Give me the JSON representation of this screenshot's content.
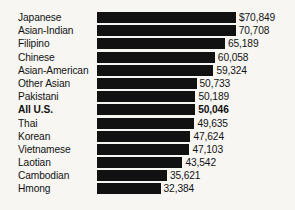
{
  "chart_data": {
    "type": "bar",
    "orientation": "horizontal",
    "title": "",
    "subtitle": "",
    "xlabel": "",
    "ylabel": "",
    "grid": false,
    "legend": false,
    "axis_visible": false,
    "xlim": [
      0,
      70849
    ],
    "bar_color": "#111111",
    "background_color": "#f7f6f3",
    "text_color": "#121212",
    "categories": [
      "Japanese",
      "Asian-Indian",
      "Filipino",
      "Chinese",
      "Asian-American",
      "Other Asian",
      "Pakistani",
      "All U.S.",
      "Thai",
      "Korean",
      "Vietnamese",
      "Laotian",
      "Cambodian",
      "Hmong"
    ],
    "values": [
      70849,
      70708,
      65189,
      60058,
      59324,
      50733,
      50189,
      50046,
      49635,
      47624,
      47103,
      43542,
      35621,
      32384
    ],
    "value_labels": [
      "$70,849",
      "70,708",
      "65,189",
      "60,058",
      "59,324",
      "50,733",
      "50,189",
      "50,046",
      "49,635",
      "47,624",
      "47,103",
      "43,542",
      "35,621",
      "32,384"
    ],
    "emphasized_categories": [
      "All U.S."
    ],
    "rows": [
      {
        "label": "Japanese",
        "value": 70849,
        "value_label": "$70,849",
        "bold": false
      },
      {
        "label": "Asian-Indian",
        "value": 70708,
        "value_label": "70,708",
        "bold": false
      },
      {
        "label": "Filipino",
        "value": 65189,
        "value_label": "65,189",
        "bold": false
      },
      {
        "label": "Chinese",
        "value": 60058,
        "value_label": "60,058",
        "bold": false
      },
      {
        "label": "Asian-American",
        "value": 59324,
        "value_label": "59,324",
        "bold": false
      },
      {
        "label": "Other Asian",
        "value": 50733,
        "value_label": "50,733",
        "bold": false
      },
      {
        "label": "Pakistani",
        "value": 50189,
        "value_label": "50,189",
        "bold": false
      },
      {
        "label": "All U.S.",
        "value": 50046,
        "value_label": "50,046",
        "bold": true
      },
      {
        "label": "Thai",
        "value": 49635,
        "value_label": "49,635",
        "bold": false
      },
      {
        "label": "Korean",
        "value": 47624,
        "value_label": "47,624",
        "bold": false
      },
      {
        "label": "Vietnamese",
        "value": 47103,
        "value_label": "47,103",
        "bold": false
      },
      {
        "label": "Laotian",
        "value": 43542,
        "value_label": "43,542",
        "bold": false
      },
      {
        "label": "Cambodian",
        "value": 35621,
        "value_label": "35,621",
        "bold": false
      },
      {
        "label": "Hmong",
        "value": 32384,
        "value_label": "32,384",
        "bold": false
      }
    ]
  },
  "layout": {
    "bar_origin_x": 97,
    "px_per_unit": 0.0019619,
    "row_pitch": 13.2,
    "top_offset": 11,
    "value_gap": 3
  }
}
